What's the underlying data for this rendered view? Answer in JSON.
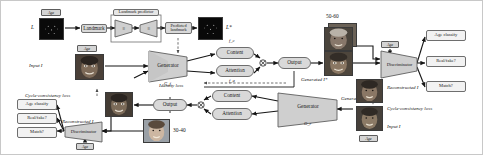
{
  "figure": {
    "type": "architecture-diagram",
    "background": "#ffffff",
    "palette": {
      "box_fill": "#d9d9d9",
      "box_stroke": "#6e6e6e",
      "shape_fill": "#cfcfcf",
      "arrow": "#1a1a1a",
      "dashed": "#555555"
    }
  },
  "landmark_path": {
    "source_image_label": "L",
    "age_chip": "Age",
    "landmark_box": "Landmark",
    "predictor_title": "Landmark predictor",
    "encoder_symbol": "≡",
    "decoder_symbol": "≡",
    "predicted_box": "Predicted landmark",
    "target_image_label": "L*"
  },
  "forward_path": {
    "input_label": "Input I",
    "age_chip": "Age",
    "generator_label": "Generator",
    "generator_sub": "G_f",
    "content_box": "Content",
    "content_feature": "f_c",
    "attention_box": "Attention",
    "attention_feature": "f_a",
    "output_box": "Output",
    "generated_label": "Generated I*",
    "target_age_range": "50-60"
  },
  "forward_discriminator": {
    "age_chip": "Age",
    "label": "Discriminator",
    "outputs": [
      "Age classify",
      "Real/fake?",
      "Match?"
    ]
  },
  "reverse_path": {
    "generator_label": "Generator",
    "generator_sub": "G_r",
    "content_box": "Content",
    "attention_box": "Attention",
    "output_box": "Output",
    "generated_label": "Generated I*",
    "reconstructed_label": "Reconstructed I",
    "input_label": "Input I",
    "age_chip": "Age",
    "source_age_range": "30-40"
  },
  "reverse_discriminator": {
    "age_chip": "Age",
    "label": "Discriminator",
    "outputs": [
      "Age classify",
      "Real/fake?",
      "Match?"
    ]
  },
  "losses": {
    "identity_loss": "Identity loss",
    "cycle_left": "Cycle-consistency loss",
    "cycle_right": "Cycle-consistency loss"
  }
}
